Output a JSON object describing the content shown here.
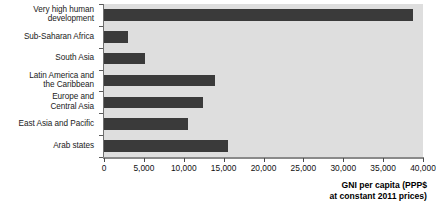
{
  "chart_data": {
    "type": "bar",
    "orientation": "horizontal",
    "title": "",
    "xlabel": "GNI per capita (PPP$ at constant 2011 prices)",
    "ylabel": "",
    "xlim": [
      0,
      40000
    ],
    "xticks": [
      0,
      5000,
      10000,
      15000,
      20000,
      25000,
      30000,
      35000,
      40000
    ],
    "xtick_labels": [
      "0",
      "5,000",
      "10,000",
      "15,000",
      "20,000",
      "25,000",
      "30,000",
      "35,000",
      "40,000"
    ],
    "grid": false,
    "legend": false,
    "categories": [
      "Very high human development",
      "Sub-Saharan Africa",
      "South Asia",
      "Latin America and the Caribbean",
      "Europe and Central Asia",
      "East Asia and Pacific",
      "Arab states"
    ],
    "values": [
      38800,
      3000,
      5100,
      13900,
      12400,
      10500,
      15600
    ],
    "bar_color": "#3a3a3a",
    "plot_background": "#dedede"
  },
  "axis_title_lines": [
    "GNI per capita (PPP$",
    "at constant 2011 prices)"
  ],
  "category_label_lines": [
    [
      "Very high human",
      "development"
    ],
    [
      "Sub-Saharan Africa"
    ],
    [
      "South Asia"
    ],
    [
      "Latin America and",
      "the Caribbean"
    ],
    [
      "Europe and",
      "Central Asia"
    ],
    [
      "East Asia and Pacific"
    ],
    [
      "Arab states"
    ]
  ]
}
